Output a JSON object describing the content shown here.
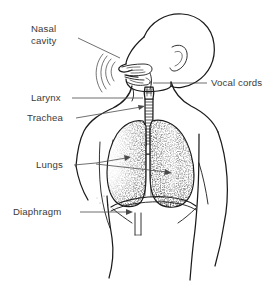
{
  "figure": {
    "background_color": "#ffffff",
    "line_color": "#1b1b1b",
    "text_color": "#3a3a3a",
    "width": 277,
    "height": 287
  },
  "labels": [
    {
      "id": "nasal-cavity",
      "line1": "Nasal",
      "line2": "cavity",
      "text_x": 31,
      "text_y": 32,
      "side": "left",
      "leader": "M 78 38 L 120 58",
      "arrow": false
    },
    {
      "id": "vocal-cords",
      "line1": "Vocal cords",
      "line2": "",
      "text_x": 211,
      "text_y": 86,
      "side": "right",
      "leader": "M 207 83 L 153 83",
      "arrow": false
    },
    {
      "id": "larynx",
      "line1": "Larynx",
      "line2": "",
      "text_x": 31,
      "text_y": 101,
      "side": "left",
      "leader": "M 72 98 L 143 98",
      "arrow": false
    },
    {
      "id": "trachea",
      "line1": "Trachea",
      "line2": "",
      "text_x": 27,
      "text_y": 121,
      "side": "left",
      "leader": "M 76 118 L 145 107",
      "arrow": true
    },
    {
      "id": "lungs",
      "line1": "Lungs",
      "line2": "",
      "text_x": 36,
      "text_y": 168,
      "side": "left",
      "leader": "M 74 165 L 131 159",
      "arrow": true
    },
    {
      "id": "diaphragm",
      "line1": "Diaphragm",
      "line2": "",
      "text_x": 13,
      "text_y": 215,
      "side": "left",
      "leader": "M 80 212 L 133 212",
      "arrow": true
    }
  ],
  "parts": [
    {
      "id": "head",
      "name": "head-profile"
    },
    {
      "id": "ear",
      "name": "ear"
    },
    {
      "id": "nasal-passage",
      "name": "nasal-cavity-passage"
    },
    {
      "id": "airflow-arcs",
      "name": "airflow-arcs"
    },
    {
      "id": "mouth",
      "name": "mouth-and-tongue"
    },
    {
      "id": "larynx",
      "name": "larynx"
    },
    {
      "id": "trachea",
      "name": "trachea-with-cartilage-rings"
    },
    {
      "id": "bronchi",
      "name": "bronchi"
    },
    {
      "id": "lung-left",
      "name": "left-lung"
    },
    {
      "id": "lung-right",
      "name": "right-lung"
    },
    {
      "id": "diaphragm",
      "name": "diaphragm"
    },
    {
      "id": "torso",
      "name": "torso-outline"
    },
    {
      "id": "arm-left",
      "name": "left-arm-outline"
    },
    {
      "id": "arm-right",
      "name": "right-arm-outline"
    },
    {
      "id": "ribcage",
      "name": "ribcage-hint"
    }
  ]
}
